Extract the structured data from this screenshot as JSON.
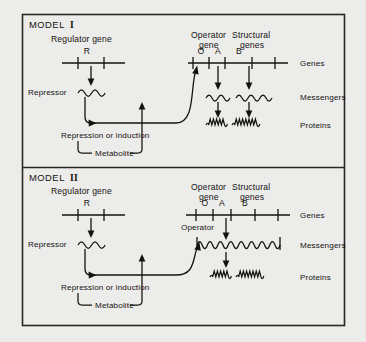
{
  "figure": {
    "background_color": "#ececeb",
    "ink_color": "#16130f",
    "border_color": "#2a2724"
  },
  "panels": [
    {
      "id": "model-1",
      "title_prefix": "MODEL",
      "title_numeral": "I",
      "regulator_title": "Regulator gene",
      "regulator_marker": "R",
      "operator_title_line1": "Operator",
      "operator_title_line2": "gene",
      "structural_title_line1": "Structural",
      "structural_title_line2": "genes",
      "gene_markers": [
        "O",
        "A",
        "B"
      ],
      "repressor_label": "Repressor",
      "feedback_label": "Repression or induction",
      "metabolite_label": "Metabolite",
      "row_labels": [
        "Genes",
        "Messengers",
        "Proteins"
      ],
      "messenger_count": 2,
      "protein_count": 2
    },
    {
      "id": "model-2",
      "title_prefix": "MODEL",
      "title_numeral": "II",
      "regulator_title": "Regulator gene",
      "regulator_marker": "R",
      "operator_title_line1": "Operator",
      "operator_title_line2": "gene",
      "structural_title_line1": "Structural",
      "structural_title_line2": "genes",
      "gene_markers": [
        "O",
        "A",
        "B"
      ],
      "repressor_label": "Repressor",
      "operator_messenger_label": "Operator",
      "feedback_label": "Repression or induction",
      "metabolite_label": "Metabolite",
      "row_labels": [
        "Genes",
        "Messengers",
        "Proteins"
      ],
      "messenger_count": 1,
      "protein_count": 2
    }
  ]
}
